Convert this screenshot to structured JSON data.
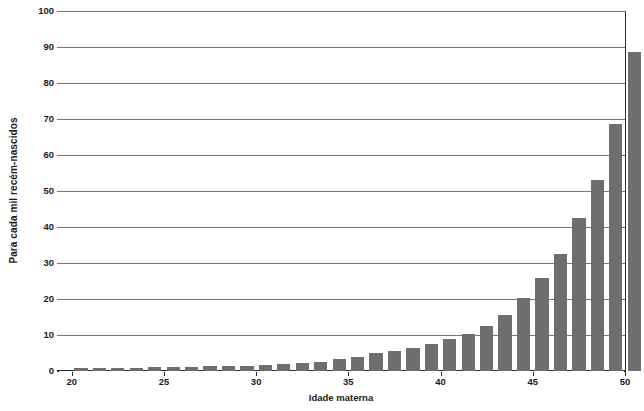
{
  "chart_data": {
    "type": "bar",
    "title": "",
    "subtitle": "",
    "xlabel": "Idade materna",
    "ylabel": "Para cada mil recém-nascidos",
    "xlim": [
      19.2,
      50
    ],
    "ylim": [
      0,
      100
    ],
    "grid": true,
    "legend": null,
    "bar_color": "#6e6e6e",
    "axis_color": "#2b2b2b",
    "gridline_color": "#767676",
    "background": "#ffffff",
    "y_ticks": [
      0,
      10,
      20,
      30,
      40,
      50,
      60,
      70,
      80,
      90,
      100
    ],
    "y_tick_labels": [
      "0",
      "10",
      "20",
      "30",
      "40",
      "50",
      "60",
      "70",
      "80",
      "90",
      "100"
    ],
    "x_ticks": [
      20,
      25,
      30,
      35,
      40,
      45,
      50
    ],
    "x_tick_labels": [
      "20",
      "25",
      "30",
      "35",
      "40",
      "45",
      "50"
    ],
    "categories": [
      20,
      21,
      22,
      23,
      24,
      25,
      26,
      27,
      28,
      29,
      30,
      31,
      32,
      33,
      34,
      35,
      36,
      37,
      38,
      39,
      40,
      41,
      42,
      43,
      44,
      45,
      46,
      47,
      48,
      49
    ],
    "values": [
      0.8,
      0.8,
      0.9,
      0.9,
      1.0,
      1.1,
      1.2,
      1.3,
      1.4,
      1.5,
      1.7,
      1.9,
      2.2,
      2.6,
      3.2,
      4.0,
      5.0,
      5.6,
      6.4,
      7.5,
      8.8,
      10.3,
      12.4,
      15.6,
      20.4,
      25.8,
      32.4,
      42.5,
      53.0,
      68.5
    ],
    "values_last": 88.6,
    "annotations": []
  }
}
